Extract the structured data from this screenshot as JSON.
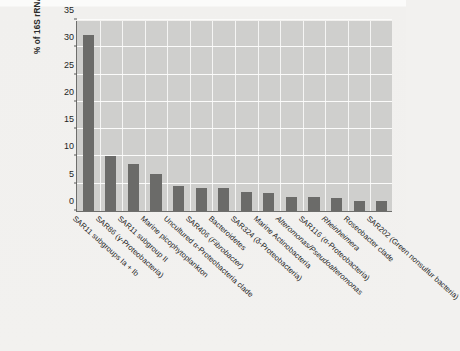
{
  "figure": {
    "y_axis_title": "% of 16S rRNA sequences",
    "y_ticks": [
      "0",
      "5",
      "10",
      "15",
      "20",
      "25",
      "30",
      "35"
    ]
  },
  "chart_data": {
    "type": "bar",
    "title": "",
    "xlabel": "",
    "ylabel": "% of 16S rRNA sequences",
    "ylim": [
      0,
      35
    ],
    "yticks": [
      0,
      5,
      10,
      15,
      20,
      25,
      30,
      35
    ],
    "grid": true,
    "legend": "none",
    "orientation": "vertical",
    "bar_color": "#6b6b69",
    "plot_background": "#cfcfcd",
    "categories": [
      "SAR11 subgroups Ia + Ib",
      "SAR86 (γ-Proteobacteria)",
      "SAR11 subgroup II",
      "Marine picophytoplankton",
      "Uncultured α-Proteobacteria clade",
      "SAR406 (Fibrobacter)",
      "Bacteroidetes",
      "SAR324 (δ-Proteobacteria)",
      "Marine Actinobacteria",
      "Alteromonas/Pseudoalteromonas",
      "SAR116 (α-Proteobacteria)",
      "Rheinheimera",
      "Roseobacter clade",
      "SAR202 (Green nonsulfur bacteria)"
    ],
    "values": [
      32.2,
      10.1,
      8.7,
      6.8,
      4.6,
      4.3,
      4.2,
      3.4,
      3.3,
      2.5,
      2.5,
      2.3,
      1.8,
      1.8
    ],
    "label_styles": [
      "normal",
      "normal",
      "normal",
      "normal",
      "normal",
      "partial-italic",
      "normal",
      "normal",
      "normal",
      "italic",
      "normal",
      "italic",
      "normal",
      "normal"
    ]
  }
}
